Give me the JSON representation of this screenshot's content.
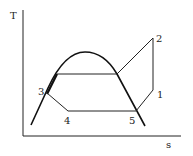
{
  "diagram": {
    "type": "T-s diagram",
    "axes": {
      "y_label": "T",
      "x_label": "s"
    },
    "points": [
      {
        "id": "1",
        "label": "1"
      },
      {
        "id": "2",
        "label": "2"
      },
      {
        "id": "3",
        "label": "3"
      },
      {
        "id": "4",
        "label": "4"
      },
      {
        "id": "5",
        "label": "5"
      }
    ],
    "colors": {
      "line": "#1a1a1a",
      "background": "#ffffff"
    }
  }
}
